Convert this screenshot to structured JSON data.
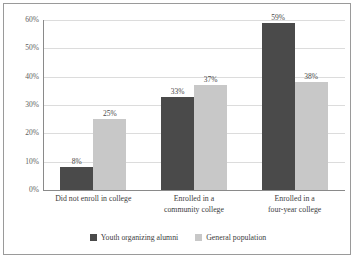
{
  "chart_data": {
    "type": "bar",
    "title": "",
    "subtitle": "",
    "xlabel": "",
    "ylabel": "",
    "ylim": [
      0,
      60
    ],
    "ytick_labels": [
      "60%",
      "50%",
      "40%",
      "30%",
      "20%",
      "10%",
      "0%"
    ],
    "ytick_values": [
      60,
      50,
      40,
      30,
      20,
      10,
      0
    ],
    "grid": true,
    "legend_position": "bottom",
    "categories": [
      "Did not enroll in college",
      "Enrolled in a community college",
      "Enrolled in a four-year college"
    ],
    "category_lines": [
      [
        "Did not enroll in college"
      ],
      [
        "Enrolled in a",
        "community college"
      ],
      [
        "Enrolled in a",
        "four-year college"
      ]
    ],
    "series": [
      {
        "name": "Youth organizing alumni",
        "color": "#4a4a4a",
        "values": [
          8,
          33,
          59
        ],
        "data_labels": [
          "8%",
          "33%",
          "59%"
        ]
      },
      {
        "name": "General population",
        "color": "#c8c8c8",
        "values": [
          25,
          37,
          38
        ],
        "data_labels": [
          "25%",
          "37%",
          "38%"
        ]
      }
    ]
  },
  "colors": {
    "series_dark": "#4a4a4a",
    "series_light": "#c8c8c8",
    "gridline": "#dcdcdc",
    "axis": "#8a8a8a",
    "border": "#9a9a9a",
    "text": "#3d3d3d"
  }
}
